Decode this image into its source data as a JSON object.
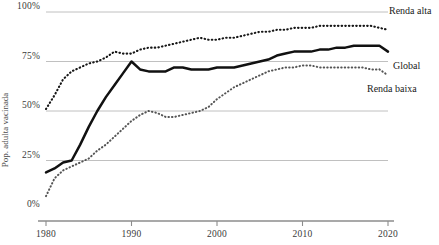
{
  "chart_data": {
    "type": "line",
    "title": "",
    "xlabel": "",
    "ylabel": "Pop. adulta vacinada",
    "xlim": [
      1980,
      2020
    ],
    "ylim": [
      0,
      100
    ],
    "grid": true,
    "legend_position": "right-inline",
    "x_ticks": [
      "1980",
      "1990",
      "2000",
      "2010",
      "2020"
    ],
    "x_tick_values": [
      1980,
      1990,
      2000,
      2010,
      2020
    ],
    "y_ticks": [
      "0%",
      "25%",
      "50%",
      "75%",
      "100%"
    ],
    "y_tick_values": [
      0,
      25,
      50,
      75,
      100
    ],
    "x": [
      1980,
      1981,
      1982,
      1983,
      1984,
      1985,
      1986,
      1987,
      1988,
      1989,
      1990,
      1991,
      1992,
      1993,
      1994,
      1995,
      1996,
      1997,
      1998,
      1999,
      2000,
      2001,
      2002,
      2003,
      2004,
      2005,
      2006,
      2007,
      2008,
      2009,
      2010,
      2011,
      2012,
      2013,
      2014,
      2015,
      2016,
      2017,
      2018,
      2019,
      2020
    ],
    "series": [
      {
        "name": "Renda alta",
        "style": "dotted",
        "color": "#171717",
        "label_x": 2020,
        "values": [
          51,
          58,
          66,
          70,
          72,
          74,
          75,
          77,
          80,
          79,
          79,
          81,
          82,
          82,
          83,
          84,
          85,
          86,
          87,
          86,
          86,
          87,
          87,
          88,
          89,
          90,
          90,
          91,
          91,
          92,
          92,
          92,
          93,
          93,
          93,
          93,
          93,
          93,
          93,
          92,
          91
        ]
      },
      {
        "name": "Global",
        "style": "solid",
        "color": "#111111",
        "label_x": 2020,
        "values": [
          19,
          21,
          24,
          25,
          33,
          42,
          50,
          57,
          63,
          69,
          75,
          71,
          70,
          70,
          70,
          72,
          72,
          71,
          71,
          71,
          72,
          72,
          72,
          73,
          74,
          75,
          76,
          78,
          79,
          80,
          80,
          80,
          81,
          81,
          82,
          82,
          83,
          83,
          83,
          83,
          80
        ]
      },
      {
        "name": "Renda baixa",
        "style": "dotted",
        "color": "#555555",
        "label_x": 2020,
        "values": [
          7,
          16,
          20,
          22,
          24,
          26,
          30,
          33,
          37,
          41,
          45,
          48,
          50,
          49,
          47,
          47,
          48,
          49,
          50,
          52,
          56,
          59,
          62,
          64,
          66,
          68,
          70,
          71,
          72,
          72,
          73,
          73,
          72,
          72,
          72,
          72,
          72,
          72,
          71,
          71,
          68
        ]
      }
    ]
  },
  "labels": {
    "high_income": "Renda alta",
    "global": "Global",
    "low_income": "Renda baixa",
    "y_axis_title": "Pop. adulta vacinada"
  }
}
